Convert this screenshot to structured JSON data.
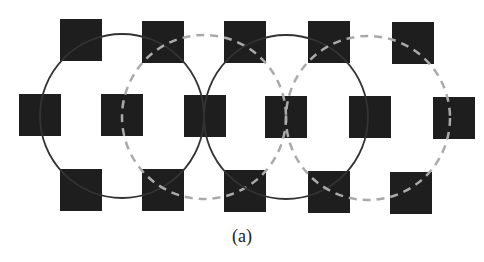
{
  "figure": {
    "caption": "(a)",
    "colors": {
      "square": "#1e1e1e",
      "solid_circle": "#333333",
      "dashed_circle": "#aaaaaa"
    },
    "square_size": 42,
    "squares": [
      {
        "x": 60,
        "y": 19
      },
      {
        "x": 142,
        "y": 21
      },
      {
        "x": 224,
        "y": 21
      },
      {
        "x": 308,
        "y": 21
      },
      {
        "x": 392,
        "y": 22
      },
      {
        "x": 19,
        "y": 94
      },
      {
        "x": 101,
        "y": 94
      },
      {
        "x": 184,
        "y": 95
      },
      {
        "x": 265,
        "y": 96
      },
      {
        "x": 349,
        "y": 96
      },
      {
        "x": 433,
        "y": 97
      },
      {
        "x": 60,
        "y": 169
      },
      {
        "x": 142,
        "y": 169
      },
      {
        "x": 224,
        "y": 170
      },
      {
        "x": 308,
        "y": 171
      },
      {
        "x": 390,
        "y": 172
      }
    ],
    "circles": [
      {
        "cx": 122,
        "cy": 116,
        "r": 82,
        "style": "solid"
      },
      {
        "cx": 204,
        "cy": 117,
        "r": 82,
        "style": "dashed"
      },
      {
        "cx": 286,
        "cy": 117,
        "r": 82,
        "style": "solid"
      },
      {
        "cx": 368,
        "cy": 118,
        "r": 82,
        "style": "dashed"
      }
    ]
  }
}
